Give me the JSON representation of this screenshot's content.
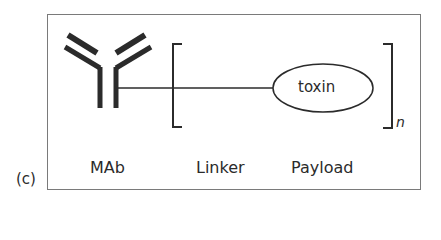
{
  "panel": {
    "label": "(c)"
  },
  "diagram": {
    "components": [
      {
        "id": "mab",
        "label": "MAb",
        "shape": "antibody-Y"
      },
      {
        "id": "linker",
        "label": "Linker",
        "shape": "line"
      },
      {
        "id": "payload",
        "label": "Payload",
        "shape": "ellipse",
        "inner_text": "toxin"
      }
    ],
    "bracket_subscript": "n",
    "colors": {
      "stroke": "#2b2b2b",
      "frame": "#7a7a7a",
      "background": "#ffffff"
    }
  },
  "labels": {
    "mab": "MAb",
    "linker": "Linker",
    "payload": "Payload",
    "toxin": "toxin",
    "n": "n",
    "panel": "(c)"
  }
}
